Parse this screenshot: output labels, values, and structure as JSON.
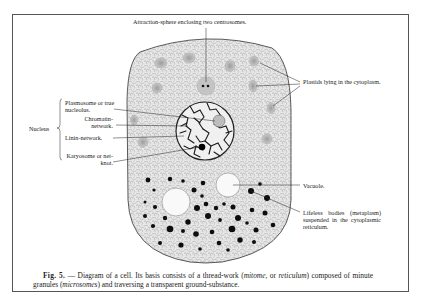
{
  "figure": {
    "number_label": "Fig. 5.",
    "caption": {
      "part1": "— Diagram of a cell.  Its basis consists of a thread-work (",
      "term1": "mitome",
      "part2": ", or ",
      "term2": "reticulum",
      "part3": ") composed of minute granules (",
      "term3": "microsomes",
      "part4": ") and traversing a transparent ground-substance."
    }
  },
  "labels": {
    "attraction_sphere": "Attraction-sphere enclosing two centrosomes.",
    "plastids": "Plastids lying in the cytoplasm.",
    "nucleus": "Nucleus",
    "plasmosome": "Plasmosome or true nucleolus.",
    "chromatin": "Chromatin-network.",
    "linin": "Linin-network.",
    "karyosome": "Karyosome or net-knot.",
    "vacuole": "Vacuole.",
    "lifeless_bodies": "Lifeless bodies (metaplasm) suspended in the cytoplasmic reticulum."
  },
  "colors": {
    "ink": "#222222",
    "cytoplasm": "#e6e6e6",
    "plastid": "#b8b8b8",
    "vacuole": "#f8f8f8",
    "frame": "#555555"
  }
}
